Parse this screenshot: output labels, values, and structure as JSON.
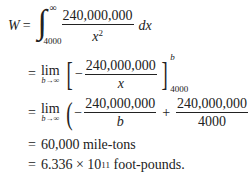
{
  "equation": {
    "lhs": "W",
    "equals": "=",
    "integral": {
      "lower_limit": "4000",
      "upper_limit": "∞",
      "numerator": "240,000,000",
      "denominator_base": "x",
      "denominator_exp": "2",
      "differential": "dx"
    },
    "step2": {
      "lim_word": "lim",
      "lim_sub": "b→∞",
      "minus": "−",
      "numerator": "240,000,000",
      "denominator": "x",
      "eval_upper": "b",
      "eval_lower": "4000"
    },
    "step3": {
      "lim_word": "lim",
      "lim_sub": "b→∞",
      "minus": "−",
      "term1_numerator": "240,000,000",
      "term1_denominator": "b",
      "plus": "+",
      "term2_numerator": "240,000,000",
      "term2_denominator": "4000"
    },
    "step4": {
      "value": "60,000 mile-tons"
    },
    "step5": {
      "mantissa": "6.336 × 10",
      "exponent": "11",
      "unit": " foot-pounds."
    }
  }
}
